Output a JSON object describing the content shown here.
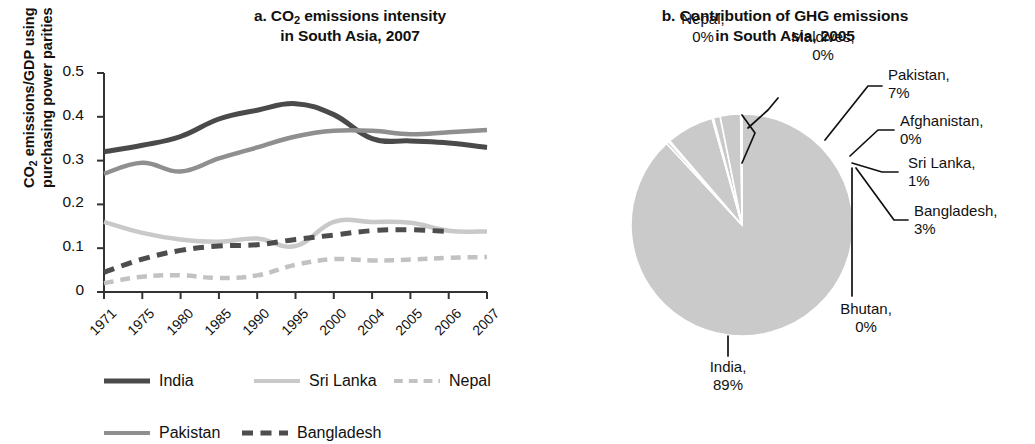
{
  "figure": {
    "panel_a": {
      "title_line1": "a. CO2 emissions intensity",
      "title_line2": "in South Asia, 2007",
      "title_prefix": "a. CO",
      "title_sub": "2",
      "title_suffix": " emissions intensity",
      "y_axis_label_line1": "CO2 emissions/GDP using",
      "y_axis_label_prefix": "CO",
      "y_axis_label_sub": "2",
      "y_axis_label_suffix": " emissions/GDP using",
      "y_axis_label_line2": "purchasing power parities"
    },
    "panel_b": {
      "title_line1": "b. Contribution of GHG emissions",
      "title_line2": "in South Asia, 2005"
    }
  },
  "legend": {
    "rows": [
      [
        {
          "label": "India",
          "color": "#4a4a4a",
          "style": "solid",
          "width": 5
        },
        {
          "label": "Sri Lanka",
          "color": "#c9c9c9",
          "style": "solid",
          "width": 4
        },
        {
          "label": "Nepal",
          "color": "#c2c2c2",
          "style": "dashed",
          "width": 4
        }
      ],
      [
        {
          "label": "Pakistan",
          "color": "#8f8f8f",
          "style": "solid",
          "width": 4
        },
        {
          "label": "Bangladesh",
          "color": "#4d4d4d",
          "style": "dashed",
          "width": 5
        }
      ]
    ]
  },
  "chart_data": [
    {
      "type": "line",
      "id": "co2-intensity-south-asia",
      "title": "a. CO2 emissions intensity in South Asia, 2007",
      "xlabel": "",
      "ylabel": "CO2 emissions/GDP using purchasing power parities",
      "categories": [
        "1971",
        "1975",
        "1980",
        "1985",
        "1990",
        "1995",
        "2000",
        "2004",
        "2005",
        "2006",
        "2007"
      ],
      "ylim": [
        0,
        0.5
      ],
      "yticks": [
        "0",
        "0.1",
        "0.2",
        "0.3",
        "0.4",
        "0.5"
      ],
      "ytick_values": [
        0,
        0.1,
        0.2,
        0.3,
        0.4,
        0.5
      ],
      "grid": false,
      "legend_position": "bottom",
      "series": [
        {
          "name": "India",
          "color": "#4a4a4a",
          "style": "solid",
          "width": 5,
          "values": [
            0.32,
            0.335,
            0.355,
            0.395,
            0.415,
            0.43,
            0.405,
            0.35,
            0.345,
            0.34,
            0.33
          ]
        },
        {
          "name": "Pakistan",
          "color": "#8f8f8f",
          "style": "solid",
          "width": 4.5,
          "values": [
            0.27,
            0.295,
            0.275,
            0.305,
            0.33,
            0.355,
            0.368,
            0.368,
            0.36,
            0.365,
            0.37
          ]
        },
        {
          "name": "Sri Lanka",
          "color": "#c9c9c9",
          "style": "solid",
          "width": 4.5,
          "values": [
            0.16,
            0.135,
            0.12,
            0.115,
            0.122,
            0.105,
            0.16,
            0.16,
            0.158,
            0.14,
            0.138
          ]
        },
        {
          "name": "Bangladesh",
          "color": "#4d4d4d",
          "style": "dashed",
          "width": 5,
          "values": [
            0.045,
            0.075,
            0.095,
            0.105,
            0.108,
            0.12,
            0.13,
            0.14,
            0.142,
            0.138,
            null
          ]
        },
        {
          "name": "Nepal",
          "color": "#c2c2c2",
          "style": "dashed",
          "width": 4.5,
          "values": [
            0.02,
            0.035,
            0.038,
            0.032,
            0.038,
            0.062,
            0.075,
            0.072,
            0.074,
            0.078,
            0.08
          ]
        }
      ]
    },
    {
      "type": "pie",
      "id": "ghg-contribution-south-asia",
      "title": "b. Contribution of GHG emissions in South Asia, 2005",
      "start_angle": 0,
      "direction": "clockwise",
      "slice_color": "#cacaca",
      "separator_color": "#ffffff",
      "labels": [
        "India",
        "Nepal",
        "Maldives",
        "Pakistan",
        "Afghanistan",
        "Sri Lanka",
        "Bangladesh",
        "Bhutan"
      ],
      "values": [
        89,
        0,
        0,
        7,
        0,
        1,
        3,
        0
      ],
      "slices": [
        {
          "name": "India",
          "percent_label": "89%",
          "value": 89
        },
        {
          "name": "Nepal",
          "percent_label": "0%",
          "value": 0.4
        },
        {
          "name": "Maldives",
          "percent_label": "0%",
          "value": 0.2
        },
        {
          "name": "Pakistan",
          "percent_label": "7%",
          "value": 7
        },
        {
          "name": "Afghanistan",
          "percent_label": "0%",
          "value": 0.2
        },
        {
          "name": "Sri Lanka",
          "percent_label": "1%",
          "value": 1
        },
        {
          "name": "Bangladesh",
          "percent_label": "3%",
          "value": 3
        },
        {
          "name": "Bhutan",
          "percent_label": "0%",
          "value": 0.2
        }
      ]
    }
  ],
  "pie_callouts": [
    {
      "name": "Nepal",
      "line1": "Nepal,",
      "line2": "0%"
    },
    {
      "name": "Maldives",
      "line1": "Maldives,",
      "line2": "0%"
    },
    {
      "name": "Pakistan",
      "line1": "Pakistan,",
      "line2": "7%"
    },
    {
      "name": "Afghanistan",
      "line1": "Afghanistan,",
      "line2": "0%"
    },
    {
      "name": "Sri Lanka",
      "line1": "Sri Lanka,",
      "line2": "1%"
    },
    {
      "name": "Bangladesh",
      "line1": "Bangladesh,",
      "line2": "3%"
    },
    {
      "name": "Bhutan",
      "line1": "Bhutan,",
      "line2": "0%"
    },
    {
      "name": "India",
      "line1": "India,",
      "line2": "89%"
    }
  ]
}
